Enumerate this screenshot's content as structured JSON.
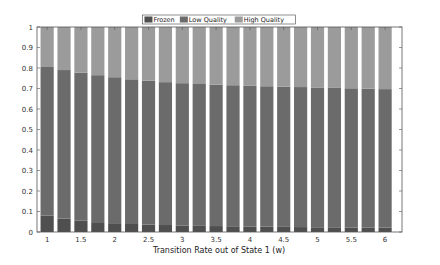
{
  "chart_data": {
    "type": "bar",
    "stacked": true,
    "title": "",
    "xlabel": "Transition Rate out of State 1 (w)",
    "ylabel": "",
    "ylim": [
      0,
      1
    ],
    "xlim": [
      0.85,
      6.25
    ],
    "grid": false,
    "legend_position": "top-center",
    "x": [
      1.0,
      1.25,
      1.5,
      1.75,
      2.0,
      2.25,
      2.5,
      2.75,
      3.0,
      3.25,
      3.5,
      3.75,
      4.0,
      4.25,
      4.5,
      4.75,
      5.0,
      5.25,
      5.5,
      5.75,
      6.0
    ],
    "x_ticks": [
      "1",
      "1.5",
      "2",
      "2.5",
      "3",
      "3.5",
      "4",
      "4.5",
      "5",
      "5.5",
      "6"
    ],
    "y_ticks": [
      "0",
      "0.1",
      "0.2",
      "0.3",
      "0.4",
      "0.5",
      "0.6",
      "0.7",
      "0.8",
      "0.9",
      "1"
    ],
    "series": [
      {
        "name": "Frozen",
        "color": "#4f4f4f",
        "values": [
          0.08,
          0.065,
          0.055,
          0.048,
          0.043,
          0.039,
          0.036,
          0.034,
          0.032,
          0.03,
          0.029,
          0.028,
          0.027,
          0.026,
          0.025,
          0.024,
          0.023,
          0.023,
          0.022,
          0.022,
          0.021
        ]
      },
      {
        "name": "Low Quality",
        "color": "#6b6b6b",
        "values": [
          0.725,
          0.725,
          0.722,
          0.717,
          0.712,
          0.706,
          0.702,
          0.697,
          0.694,
          0.692,
          0.69,
          0.688,
          0.686,
          0.685,
          0.684,
          0.683,
          0.682,
          0.68,
          0.679,
          0.677,
          0.676
        ]
      },
      {
        "name": "High Quality",
        "color": "#9b9b9b",
        "values": [
          0.195,
          0.21,
          0.223,
          0.235,
          0.245,
          0.255,
          0.262,
          0.269,
          0.274,
          0.278,
          0.281,
          0.284,
          0.287,
          0.289,
          0.291,
          0.293,
          0.295,
          0.297,
          0.299,
          0.301,
          0.303
        ]
      }
    ]
  }
}
